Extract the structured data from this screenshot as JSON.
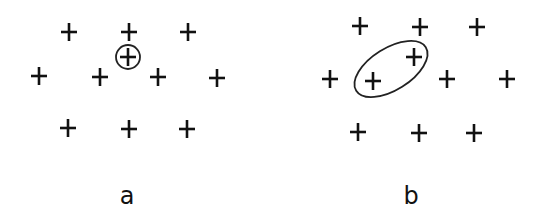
{
  "panels": [
    {
      "id": "a",
      "label": "a",
      "label_pos": [
        127,
        204
      ],
      "points": [
        [
          69,
          32
        ],
        [
          129,
          32
        ],
        [
          188,
          32
        ],
        [
          128,
          57
        ],
        [
          39,
          76
        ],
        [
          100,
          77
        ],
        [
          158,
          77
        ],
        [
          217,
          78
        ],
        [
          68,
          128
        ],
        [
          129,
          129
        ],
        [
          187,
          129
        ]
      ],
      "highlight": {
        "shape": "circle",
        "cx": 128,
        "cy": 57,
        "r": 12
      }
    },
    {
      "id": "b",
      "label": "b",
      "label_pos": [
        411,
        204
      ],
      "points": [
        [
          360,
          26
        ],
        [
          420,
          27
        ],
        [
          477,
          27
        ],
        [
          414,
          57
        ],
        [
          330,
          79
        ],
        [
          373,
          81
        ],
        [
          447,
          79
        ],
        [
          507,
          79
        ],
        [
          358,
          132
        ],
        [
          419,
          133
        ],
        [
          474,
          133
        ]
      ],
      "highlight": {
        "shape": "ellipse",
        "cx": 391,
        "cy": 69,
        "rx": 41,
        "ry": 21,
        "rotate": -32
      }
    }
  ]
}
